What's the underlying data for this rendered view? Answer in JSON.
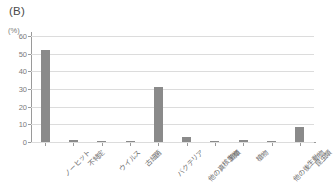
{
  "panel": {
    "label": "(B)"
  },
  "axes": {
    "y_unit": "(%)",
    "y_ticks": [
      "0",
      "10",
      "20",
      "30",
      "40",
      "50",
      "60"
    ],
    "x_labels": [
      "ノーヒット",
      "不特定",
      "ウイルス",
      "古細菌",
      "バクテリア",
      "他の真核生物",
      "菌類",
      "植物",
      "他の後生動物",
      "昆虫類"
    ]
  },
  "style": {
    "bar_color": "#8a8a8a",
    "grid_color": "#dcdcdc",
    "axis_color": "#9a9a9a",
    "text_color": "#6e6e6e"
  },
  "chart_data": {
    "type": "bar",
    "title": "(B)",
    "xlabel": "",
    "ylabel": "(%)",
    "ylim": [
      0,
      60
    ],
    "yticks": [
      0,
      10,
      20,
      30,
      40,
      50,
      60
    ],
    "grid": true,
    "legend": "none",
    "categories": [
      "ノーヒット",
      "不特定",
      "ウイルス",
      "古細菌",
      "バクテリア",
      "他の真核生物",
      "菌類",
      "植物",
      "他の後生動物",
      "昆虫類"
    ],
    "values": [
      52,
      1,
      0.3,
      0.5,
      31,
      3,
      0.4,
      1,
      0.5,
      8.5
    ]
  }
}
